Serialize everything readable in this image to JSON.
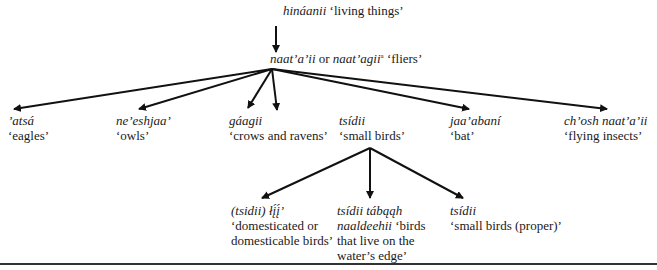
{
  "root": {
    "term": "hináanii",
    "gloss": "‘living things’"
  },
  "level1": {
    "term_a": "naat’a’ii",
    "connector": "or",
    "term_b": "naat’agii",
    "superscript": "a",
    "gloss": "‘fliers’"
  },
  "level2": [
    {
      "term": "’atsá",
      "gloss": "‘eagles’"
    },
    {
      "term": "ne’eshjaa’",
      "gloss": "‘owls’"
    },
    {
      "term": "gáagii",
      "gloss": "‘crows and ravens’"
    },
    {
      "term": "tsídii",
      "gloss": "‘small birds’"
    },
    {
      "term": "jaa’abaní",
      "gloss": "‘bat’"
    },
    {
      "term": "ch’osh naat’a’ii",
      "gloss": "‘flying insects’"
    }
  ],
  "level3": [
    {
      "term": "(tsidii) łį́į́’",
      "gloss_line1": "‘domesticated or",
      "gloss_line2": "domesticable birds’"
    },
    {
      "term": "tsídii tábąąh",
      "term_line2": "naaldeehii",
      "gloss_line2": "‘birds",
      "gloss_line3": "that live on the",
      "gloss_line4": "water’s edge’"
    },
    {
      "term": "tsídii",
      "gloss": "‘small birds (proper)’"
    }
  ]
}
